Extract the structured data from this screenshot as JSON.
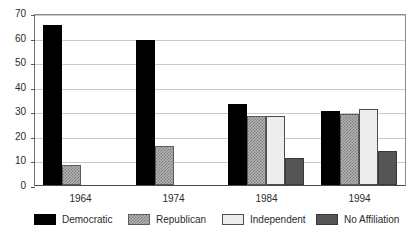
{
  "chart_data": {
    "type": "bar",
    "title": "",
    "subtitle": "",
    "xlabel": "",
    "ylabel": "",
    "categories": [
      "1964",
      "1974",
      "1984",
      "1994"
    ],
    "series": [
      {
        "name": "Democratic",
        "values": [
          65,
          59,
          33,
          30
        ],
        "color": "#000000"
      },
      {
        "name": "Republican",
        "values": [
          8,
          16,
          28,
          29
        ],
        "color": "#b4b4b4"
      },
      {
        "name": "Independent",
        "values": [
          null,
          null,
          28,
          31
        ],
        "color": "#ededed"
      },
      {
        "name": "No Affiliation",
        "values": [
          null,
          null,
          11,
          14
        ],
        "color": "#555555"
      }
    ],
    "ylim": [
      0,
      70
    ],
    "yticks": [
      0,
      10,
      20,
      30,
      40,
      50,
      60,
      70
    ],
    "ytick_labels": [
      "0",
      "10",
      "20",
      "30",
      "40",
      "50",
      "60",
      "70"
    ],
    "grid": true,
    "legend_position": "bottom"
  }
}
